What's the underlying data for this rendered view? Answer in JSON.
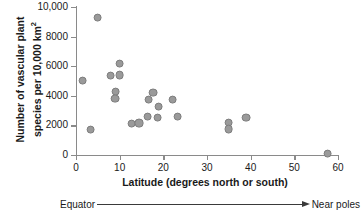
{
  "chart_data": {
    "type": "scatter",
    "title": "",
    "xlabel": "Latitude (degrees north or south)",
    "ylabel_line1": "Number of vascular plant",
    "ylabel_line2_prefix": "species per 10,000 km",
    "ylabel_line2_sup": "2",
    "xlim": [
      0,
      60
    ],
    "ylim": [
      0,
      10000
    ],
    "xticks": [
      0,
      10,
      20,
      30,
      40,
      50,
      60
    ],
    "xtick_labels": [
      "0",
      "10",
      "20",
      "30",
      "40",
      "50",
      "60"
    ],
    "yticks": [
      0,
      2000,
      4000,
      6000,
      8000,
      10000
    ],
    "ytick_labels": [
      "0",
      "2000",
      "4000",
      "6000",
      "8000",
      "10,000"
    ],
    "grid": false,
    "legend": false,
    "marker_color": "#9a9a9a",
    "marker_edge_color": "#7d7d7d",
    "axis_color": "#8a8a8a",
    "points": [
      {
        "x": 1.4,
        "y": 5100
      },
      {
        "x": 3.2,
        "y": 1750
      },
      {
        "x": 4.8,
        "y": 9350
      },
      {
        "x": 7.8,
        "y": 5400
      },
      {
        "x": 9.8,
        "y": 6250
      },
      {
        "x": 9.9,
        "y": 5450
      },
      {
        "x": 9.0,
        "y": 4350
      },
      {
        "x": 8.8,
        "y": 3850
      },
      {
        "x": 12.6,
        "y": 2150
      },
      {
        "x": 14.3,
        "y": 2200
      },
      {
        "x": 16.3,
        "y": 2650
      },
      {
        "x": 16.5,
        "y": 3800
      },
      {
        "x": 17.5,
        "y": 4250
      },
      {
        "x": 18.6,
        "y": 2550
      },
      {
        "x": 18.8,
        "y": 3300
      },
      {
        "x": 22.0,
        "y": 3800
      },
      {
        "x": 23.2,
        "y": 2650
      },
      {
        "x": 34.8,
        "y": 2250
      },
      {
        "x": 34.8,
        "y": 1800
      },
      {
        "x": 38.8,
        "y": 2550
      },
      {
        "x": 57.5,
        "y": 150
      }
    ],
    "annotation": {
      "left_label": "Equator",
      "right_label": "Near poles",
      "arrow_direction": "right"
    }
  }
}
